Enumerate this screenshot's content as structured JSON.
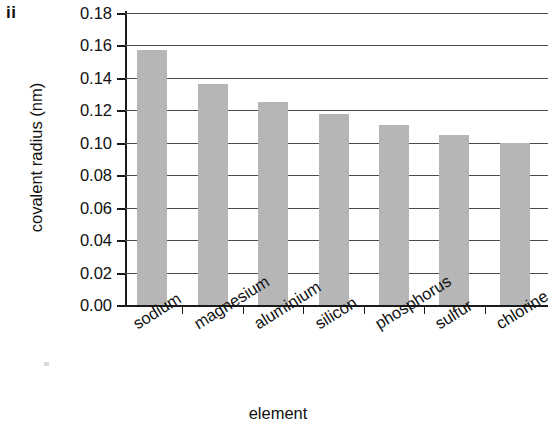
{
  "figure": {
    "enumeration_label": "ii"
  },
  "chart_data": {
    "type": "bar",
    "title": "",
    "xlabel": "element",
    "ylabel": "covalent radius (nm)",
    "categories": [
      "sodium",
      "magnesium",
      "aluminium",
      "silicon",
      "phosphorus",
      "sulfur",
      "chlorine"
    ],
    "values": [
      0.157,
      0.136,
      0.125,
      0.118,
      0.111,
      0.105,
      0.1
    ],
    "ylim": [
      0.0,
      0.18
    ],
    "ytick_step": 0.02,
    "ytick_labels": [
      "0.00",
      "0.02",
      "0.04",
      "0.06",
      "0.08",
      "0.10",
      "0.12",
      "0.14",
      "0.16",
      "0.18"
    ],
    "ytick_values": [
      0.0,
      0.02,
      0.04,
      0.06,
      0.08,
      0.1,
      0.12,
      0.14,
      0.16,
      0.18
    ],
    "grid": true,
    "grid_axis": "y",
    "legend": false,
    "bar_color": "#b6b6b6",
    "axis_color": "#1a1a1a",
    "grid_color": "#4a4a4a",
    "xtick_label_rotation_deg": -32
  }
}
